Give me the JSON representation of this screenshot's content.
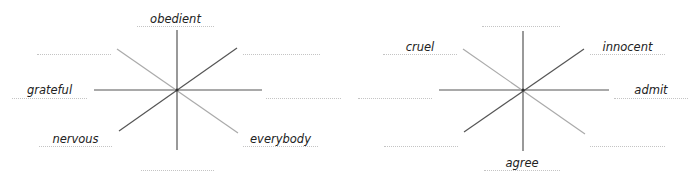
{
  "diagrams": [
    {
      "id": "left",
      "words": {
        "top": "obedient",
        "left": "grateful",
        "bottom_left": "nervous",
        "bottom_right": "everybody"
      },
      "blanks": [
        "top_left",
        "top_right",
        "right",
        "bottom"
      ]
    },
    {
      "id": "right",
      "words": {
        "top_left": "cruel",
        "top_right": "innocent",
        "right": "admit",
        "bottom": "agree"
      },
      "blanks": [
        "top",
        "left",
        "bottom_left",
        "bottom_right"
      ]
    }
  ],
  "colors": {
    "axis_dark": "#555555",
    "axis_light": "#aaaaaa",
    "dotted_line": "#c4c4c4",
    "text": "#222222"
  }
}
